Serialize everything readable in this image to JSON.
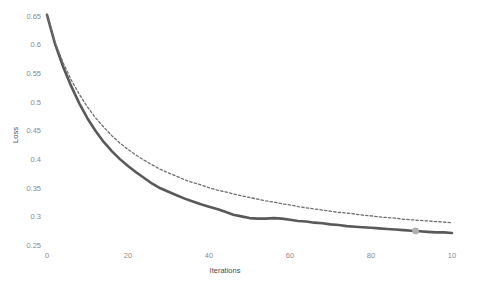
{
  "chart_data": {
    "type": "line",
    "title": "",
    "xlabel": "Iterations",
    "ylabel": "Loss",
    "xlim": [
      0,
      100
    ],
    "ylim": [
      0.25,
      0.65
    ],
    "grid": false,
    "legend": "none",
    "x_ticks": [
      "0",
      "20",
      "40",
      "60",
      "80",
      "10"
    ],
    "x_tick_values": [
      0,
      20,
      40,
      60,
      80,
      100
    ],
    "y_ticks": [
      "0.25",
      "0.3",
      "0.35",
      "0.4",
      "0.45",
      "0.5",
      "0.55",
      "0.6",
      "0.65"
    ],
    "y_tick_values": [
      0.25,
      0.3,
      0.35,
      0.4,
      0.45,
      0.5,
      0.55,
      0.6,
      0.65
    ],
    "x": [
      0,
      2,
      4,
      6,
      8,
      10,
      12,
      14,
      16,
      18,
      20,
      22,
      24,
      26,
      28,
      30,
      32,
      34,
      36,
      38,
      40,
      42,
      44,
      46,
      48,
      50,
      52,
      54,
      56,
      58,
      60,
      62,
      64,
      66,
      68,
      70,
      72,
      74,
      76,
      78,
      80,
      82,
      84,
      86,
      88,
      90,
      92,
      94,
      96,
      98,
      100
    ],
    "series": [
      {
        "name": "training-loss",
        "style": "solid",
        "color": "#595959",
        "width": 2.6,
        "values": [
          0.652,
          0.601,
          0.561,
          0.527,
          0.497,
          0.471,
          0.449,
          0.43,
          0.414,
          0.4,
          0.388,
          0.377,
          0.367,
          0.357,
          0.349,
          0.343,
          0.337,
          0.331,
          0.326,
          0.321,
          0.317,
          0.313,
          0.308,
          0.303,
          0.3,
          0.297,
          0.296,
          0.296,
          0.297,
          0.296,
          0.294,
          0.292,
          0.291,
          0.289,
          0.288,
          0.286,
          0.285,
          0.283,
          0.282,
          0.281,
          0.28,
          0.279,
          0.278,
          0.277,
          0.276,
          0.275,
          0.274,
          0.273,
          0.272,
          0.272,
          0.271
        ]
      },
      {
        "name": "validation-loss",
        "style": "dashed",
        "color": "#6e6e6e",
        "width": 1.3,
        "values": [
          0.652,
          0.604,
          0.568,
          0.538,
          0.513,
          0.491,
          0.472,
          0.456,
          0.441,
          0.428,
          0.417,
          0.407,
          0.398,
          0.39,
          0.382,
          0.376,
          0.37,
          0.364,
          0.359,
          0.355,
          0.35,
          0.346,
          0.343,
          0.339,
          0.336,
          0.333,
          0.33,
          0.327,
          0.325,
          0.322,
          0.32,
          0.317,
          0.315,
          0.313,
          0.311,
          0.309,
          0.307,
          0.306,
          0.304,
          0.302,
          0.301,
          0.299,
          0.298,
          0.297,
          0.295,
          0.294,
          0.293,
          0.292,
          0.291,
          0.29,
          0.289
        ]
      }
    ],
    "markers": [
      {
        "name": "selected-point-marker",
        "series": "training-loss",
        "x": 91,
        "y": 0.2745,
        "color": "#b0b0b0",
        "radius": 3.4
      }
    ]
  }
}
